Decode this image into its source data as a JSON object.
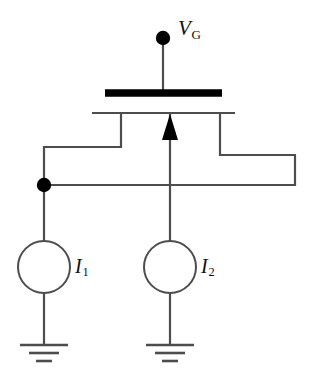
{
  "figure": {
    "type": "circuit-schematic",
    "width": 313,
    "height": 383,
    "background_color": "#ffffff",
    "line_color": "#4d4d4d",
    "bold_color": "#000000"
  },
  "labels": {
    "gate_voltage": "V",
    "gate_voltage_sub": "G",
    "current_source_1": "I",
    "current_source_1_sub": "1",
    "current_source_2": "I",
    "current_source_2_sub": "2"
  },
  "components": {
    "gate_terminal_node": {
      "name": "gate-terminal-dot",
      "cx": 163,
      "cy": 38,
      "r": 7
    },
    "gate_bar": {
      "name": "mosfet-gate-bar",
      "x1": 105,
      "x2": 222,
      "y": 93,
      "thickness": 7
    },
    "channel_line": {
      "name": "mosfet-channel-line",
      "x1": 92,
      "x2": 235,
      "y": 113,
      "thickness": 2
    },
    "bulk_arrow": {
      "name": "mosfet-bulk-arrow",
      "x": 170,
      "tip_y": 115,
      "base_y": 140,
      "direction": "up"
    },
    "junction_node": {
      "name": "junction-dot",
      "cx": 44,
      "cy": 185,
      "r": 7
    },
    "source_circle_1": {
      "name": "current-source-1",
      "cx": 44,
      "cy": 267,
      "r": 26
    },
    "source_circle_2": {
      "name": "current-source-2",
      "cx": 170,
      "cy": 267,
      "r": 26
    },
    "ground_1": {
      "name": "ground-symbol-1",
      "x": 44,
      "y": 345
    },
    "ground_2": {
      "name": "ground-symbol-2",
      "x": 170,
      "y": 345
    }
  },
  "wires": [
    {
      "name": "wire-gate-vertical",
      "path": "M163,45 L163,90"
    },
    {
      "name": "wire-left-terminal",
      "path": "M121,114 L121,147 L44,147 L44,185"
    },
    {
      "name": "wire-right-terminal",
      "path": "M220,114 L220,155 L295,155 L295,185 L44,185"
    },
    {
      "name": "wire-bulk-to-source2",
      "path": "M170,114 L170,241"
    },
    {
      "name": "wire-source1-to-node",
      "path": "M44,185 L44,241"
    },
    {
      "name": "wire-source1-to-ground",
      "path": "M44,293 L44,345"
    },
    {
      "name": "wire-source2-to-ground",
      "path": "M170,293 L170,345"
    }
  ]
}
